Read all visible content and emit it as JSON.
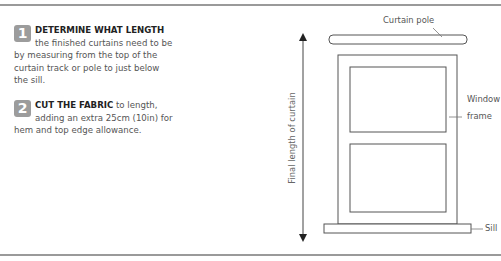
{
  "steps": [
    {
      "number": "1",
      "heading": "DETERMINE WHAT LENGTH",
      "body": " the finished curtains need to be by measuring from the top of the curtain track or pole to just below the sill."
    },
    {
      "number": "2",
      "heading": "CUT THE FABRIC",
      "body": " to length, adding an extra 25cm (10in) for hem and top edge allowance."
    }
  ],
  "diagram": {
    "labels": {
      "curtain_pole": "Curtain pole",
      "window": "Window",
      "frame": "frame",
      "sill": "Sill",
      "final_length": "Final length of curtain"
    },
    "colors": {
      "line": "#555555",
      "badge": "#9c9c9c",
      "rule": "#9a9a9a"
    }
  }
}
